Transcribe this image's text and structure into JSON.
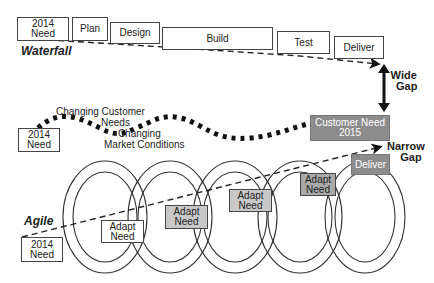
{
  "waterfall": {
    "label": "Waterfall",
    "steps": [
      {
        "line1": "2014",
        "line2": "Need"
      },
      {
        "line1": "Plan"
      },
      {
        "line1": "Design"
      },
      {
        "line1": "Build"
      },
      {
        "line1": "Test"
      },
      {
        "line1": "Deliver"
      }
    ],
    "gap_label_1": "Wide",
    "gap_label_2": "Gap"
  },
  "changing": {
    "start_box": {
      "line1": "2014",
      "line2": "Need"
    },
    "label_customer_1": "Changing Customer",
    "label_customer_2": "Needs",
    "label_market_1": "Changing",
    "label_market_2": "Market Conditions",
    "target_box": {
      "line1": "Customer Need",
      "line2": "2015"
    }
  },
  "agile": {
    "label": "Agile",
    "start_box": {
      "line1": "2014",
      "line2": "Need"
    },
    "adapt_boxes": [
      {
        "line1": "Adapt",
        "line2": "Need"
      },
      {
        "line1": "Adapt",
        "line2": "Need"
      },
      {
        "line1": "Adapt",
        "line2": "Need"
      },
      {
        "line1": "Adapt",
        "line2": "Need"
      }
    ],
    "deliver_box": "Deliver",
    "gap_label_1": "Narrow",
    "gap_label_2": "Gap"
  },
  "colors": {
    "light_gray": "#c9c9c9",
    "dark_gray": "#8c8c8c",
    "line": "#222222"
  }
}
